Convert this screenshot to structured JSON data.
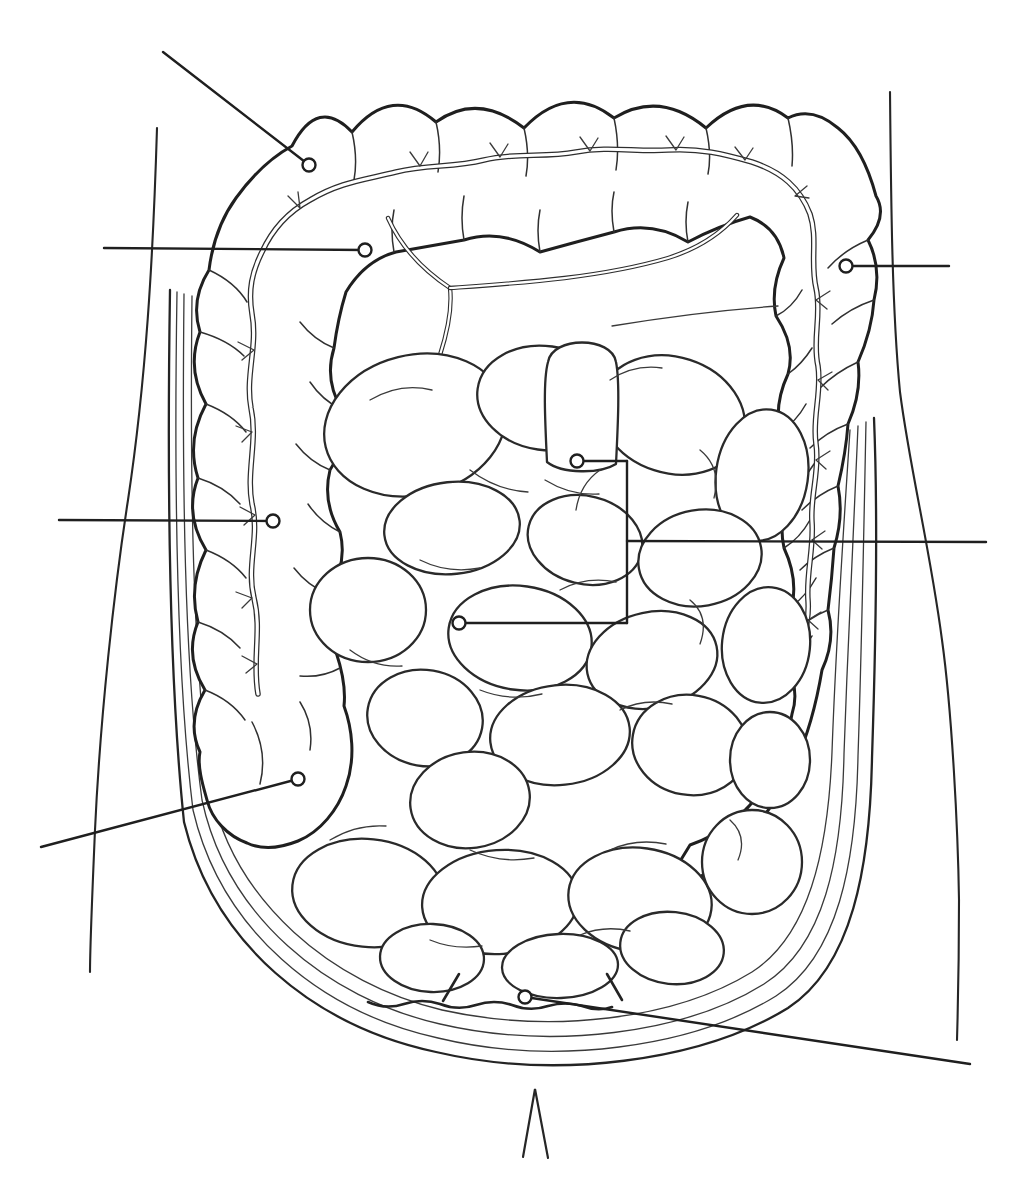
{
  "figure": {
    "type": "anatomical-line-diagram",
    "background_color": "#ffffff",
    "line_color": "#1f1f1f",
    "width_px": 1029,
    "height_px": 1200,
    "text_labels": []
  },
  "structures": [
    "body-outline",
    "abdominal-wall-layers",
    "large-intestine-band",
    "haustral-folds",
    "taenia-coli",
    "mesentery-lines",
    "small-intestine-loops",
    "cecum",
    "pelvic-wavy-line",
    "midline-notch"
  ],
  "markers": [
    {
      "name": "transverse-colon-marker",
      "circle": {
        "x": 309,
        "y": 165,
        "r": 6.5
      },
      "segments": [
        [
          163,
          52,
          309,
          165
        ]
      ]
    },
    {
      "name": "transverse-mesocolon-marker",
      "circle": {
        "x": 365,
        "y": 250,
        "r": 6.5
      },
      "segments": [
        [
          104,
          248,
          365,
          250
        ]
      ]
    },
    {
      "name": "descending-colon-marker",
      "circle": {
        "x": 846,
        "y": 266,
        "r": 6.5
      },
      "segments": [
        [
          949,
          266,
          846,
          266
        ]
      ]
    },
    {
      "name": "ascending-colon-marker",
      "circle": {
        "x": 273,
        "y": 521,
        "r": 6.5
      },
      "segments": [
        [
          59,
          520,
          273,
          521
        ]
      ]
    },
    {
      "name": "small-intestine-bracket",
      "circles": [
        {
          "x": 577,
          "y": 461,
          "r": 6.5
        },
        {
          "x": 459,
          "y": 623,
          "r": 6.5
        }
      ],
      "segments": [
        [
          577,
          461,
          627,
          461
        ],
        [
          627,
          461,
          627,
          623
        ],
        [
          627,
          623,
          459,
          623
        ],
        [
          627,
          541,
          986,
          542
        ]
      ]
    },
    {
      "name": "cecum-marker",
      "circle": {
        "x": 298,
        "y": 779,
        "r": 6.5
      },
      "segments": [
        [
          41,
          847,
          298,
          779
        ]
      ]
    },
    {
      "name": "sigmoid-colon-marker",
      "circle": {
        "x": 525,
        "y": 997,
        "r": 6.5
      },
      "segments": [
        [
          525,
          997,
          970,
          1064
        ]
      ]
    }
  ],
  "midline_notch": {
    "points": "523,1157 535,1089 548,1158"
  }
}
